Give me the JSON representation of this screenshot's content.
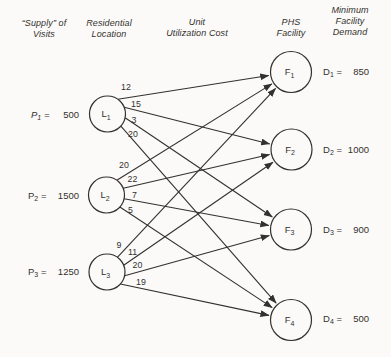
{
  "figure": {
    "columns": [
      {
        "id": "supply",
        "lines": [
          "“Supply” of",
          "Visits"
        ]
      },
      {
        "id": "residential-location",
        "lines": [
          "Residential",
          "Location"
        ]
      },
      {
        "id": "unit-utilization-cost",
        "lines": [
          "Unit",
          "Utilization Cost"
        ]
      },
      {
        "id": "phs-facility",
        "lines": [
          "PHS",
          "Facility"
        ]
      },
      {
        "id": "minimum-facility-demand",
        "lines": [
          "Minimum",
          "Facility",
          "Demand"
        ]
      }
    ],
    "supplies": [
      {
        "symbol": "P",
        "subscript": "1",
        "value": "500",
        "italic": true
      },
      {
        "symbol": "P",
        "subscript": "2",
        "value": "1500",
        "italic": false
      },
      {
        "symbol": "P",
        "subscript": "3",
        "value": "1250",
        "italic": false
      }
    ],
    "locations": [
      {
        "symbol": "L",
        "subscript": "1"
      },
      {
        "symbol": "L",
        "subscript": "2"
      },
      {
        "symbol": "L",
        "subscript": "3"
      }
    ],
    "facilities": [
      {
        "symbol": "F",
        "subscript": "1"
      },
      {
        "symbol": "F",
        "subscript": "2"
      },
      {
        "symbol": "F",
        "subscript": "3"
      },
      {
        "symbol": "F",
        "subscript": "4"
      }
    ],
    "demands": [
      {
        "symbol": "D",
        "subscript": "1",
        "value": "850"
      },
      {
        "symbol": "D",
        "subscript": "2",
        "value": "1000"
      },
      {
        "symbol": "D",
        "subscript": "3",
        "value": "900"
      },
      {
        "symbol": "D",
        "subscript": "4",
        "value": "500"
      }
    ],
    "edges": [
      {
        "from": "L1",
        "to": "F1",
        "cost": "12"
      },
      {
        "from": "L1",
        "to": "F2",
        "cost": "15"
      },
      {
        "from": "L1",
        "to": "F3",
        "cost": "3"
      },
      {
        "from": "L1",
        "to": "F4",
        "cost": "20"
      },
      {
        "from": "L2",
        "to": "F1",
        "cost": "20"
      },
      {
        "from": "L2",
        "to": "F2",
        "cost": "22"
      },
      {
        "from": "L2",
        "to": "F3",
        "cost": "7"
      },
      {
        "from": "L2",
        "to": "F4",
        "cost": "5"
      },
      {
        "from": "L3",
        "to": "F1",
        "cost": "9"
      },
      {
        "from": "L3",
        "to": "F2",
        "cost": "11"
      },
      {
        "from": "L3",
        "to": "F3",
        "cost": "20"
      },
      {
        "from": "L3",
        "to": "F4",
        "cost": "19"
      }
    ],
    "colors": {
      "ink": "#33312e",
      "background": "#fbfaf8"
    }
  }
}
